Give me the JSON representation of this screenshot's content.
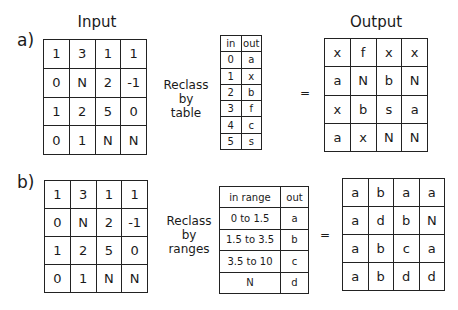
{
  "headings": {
    "input": "Input",
    "output": "Output"
  },
  "part_a": {
    "label": "a)",
    "description": [
      "Reclass",
      "by",
      "table"
    ],
    "equals": "=",
    "input_grid": [
      [
        "1",
        "3",
        "1",
        "1"
      ],
      [
        "0",
        "N",
        "2",
        "-1"
      ],
      [
        "1",
        "2",
        "5",
        "0"
      ],
      [
        "0",
        "1",
        "N",
        "N"
      ]
    ],
    "lookup_table": {
      "headers": [
        "in",
        "out"
      ],
      "rows": [
        [
          "0",
          "a"
        ],
        [
          "1",
          "x"
        ],
        [
          "2",
          "b"
        ],
        [
          "3",
          "f"
        ],
        [
          "4",
          "c"
        ],
        [
          "5",
          "s"
        ]
      ]
    },
    "output_grid": [
      [
        "x",
        "f",
        "x",
        "x"
      ],
      [
        "a",
        "N",
        "b",
        "N"
      ],
      [
        "x",
        "b",
        "s",
        "a"
      ],
      [
        "a",
        "x",
        "N",
        "N"
      ]
    ]
  },
  "part_b": {
    "label": "b)",
    "description": [
      "Reclass",
      "by",
      "ranges"
    ],
    "equals": "=",
    "input_grid": [
      [
        "1",
        "3",
        "1",
        "1"
      ],
      [
        "0",
        "N",
        "2",
        "-1"
      ],
      [
        "1",
        "2",
        "5",
        "0"
      ],
      [
        "0",
        "1",
        "N",
        "N"
      ]
    ],
    "range_table": {
      "headers": [
        "in range",
        "out"
      ],
      "rows": [
        [
          "0 to 1.5",
          "a"
        ],
        [
          "1.5 to 3.5",
          "b"
        ],
        [
          "3.5 to 10",
          "c"
        ],
        [
          "N",
          "d"
        ]
      ]
    },
    "output_grid": [
      [
        "a",
        "b",
        "a",
        "a"
      ],
      [
        "a",
        "d",
        "b",
        "N"
      ],
      [
        "a",
        "b",
        "c",
        "a"
      ],
      [
        "a",
        "b",
        "d",
        "d"
      ]
    ]
  }
}
